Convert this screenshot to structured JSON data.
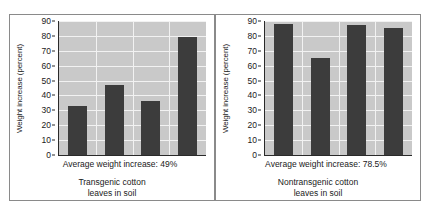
{
  "chart_data": {
    "type": "bar",
    "title": "",
    "xlabel": "",
    "ylabel": "Weight increase (percent)",
    "ylim": [
      0,
      90
    ],
    "yticks": [
      0,
      10,
      20,
      30,
      40,
      50,
      60,
      70,
      80,
      90
    ],
    "grid": true,
    "legend": "none",
    "colors": {
      "bar": "#3c3c3c",
      "plot_background": "#c9c9c9",
      "gridline": "#f2f2f2",
      "axis": "#2a2a2a",
      "border": "#8a8a8a",
      "page_background": "#ffffff"
    },
    "panels": [
      {
        "name": "transgenic",
        "categories": [
          "1",
          "2",
          "3",
          "4"
        ],
        "values": [
          33,
          47,
          36,
          79
        ],
        "average_label": "Average weight increase: 49%",
        "average_value": 49,
        "caption_line1": "Transgenic cotton",
        "caption_line2": "leaves in soil"
      },
      {
        "name": "nontransgenic",
        "categories": [
          "1",
          "2",
          "3",
          "4"
        ],
        "values": [
          88,
          65,
          87,
          85
        ],
        "average_label": "Average weight increase: 78.5%",
        "average_value": 78.5,
        "caption_line1": "Nontransgenic cotton",
        "caption_line2": "leaves in soil"
      }
    ]
  }
}
